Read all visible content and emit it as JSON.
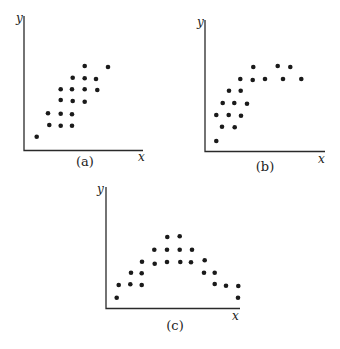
{
  "figure": {
    "colors": {
      "dot": "#1a1a1a",
      "axis": "#2a2a2a",
      "background": "#ffffff"
    }
  },
  "chart_data": [
    {
      "type": "scatter",
      "panel_label": "(a)",
      "xlabel": "x",
      "ylabel": "y",
      "grid": false,
      "pattern": "positive linear",
      "layout": {
        "origin": [
          24,
          150.5
        ],
        "y_top": 16,
        "x_right": 143,
        "ylabel_pos": [
          16,
          22
        ],
        "xlabel_pos": [
          138,
          161
        ],
        "panel_label_pos": [
          85,
          166
        ]
      },
      "points": [
        [
          36.7,
          136.7
        ],
        [
          49.3,
          125
        ],
        [
          60.7,
          125.7
        ],
        [
          72,
          125.7
        ],
        [
          48,
          113.3
        ],
        [
          60.7,
          113.7
        ],
        [
          72,
          114.3
        ],
        [
          60.7,
          100
        ],
        [
          72.7,
          101
        ],
        [
          84.7,
          101.7
        ],
        [
          60.7,
          89.3
        ],
        [
          72,
          89.3
        ],
        [
          84.7,
          89.3
        ],
        [
          97.3,
          90
        ],
        [
          72.7,
          77.7
        ],
        [
          84.7,
          78.3
        ],
        [
          96,
          79
        ],
        [
          84.7,
          66
        ],
        [
          108,
          67
        ]
      ]
    },
    {
      "type": "scatter",
      "panel_label": "(b)",
      "xlabel": "x",
      "ylabel": "y",
      "grid": false,
      "pattern": "increasing then leveling off (curvilinear)",
      "layout": {
        "origin": [
          205,
          151.5
        ],
        "y_top": 20,
        "x_right": 325,
        "ylabel_pos": [
          197,
          26
        ],
        "xlabel_pos": [
          318,
          163
        ],
        "panel_label_pos": [
          265,
          171
        ]
      },
      "points": [
        [
          216.3,
          141
        ],
        [
          222,
          126.7
        ],
        [
          234.7,
          127.3
        ],
        [
          216.3,
          115
        ],
        [
          228.7,
          115
        ],
        [
          241,
          115.7
        ],
        [
          222.7,
          103
        ],
        [
          234.3,
          103
        ],
        [
          247,
          103.7
        ],
        [
          229,
          90.7
        ],
        [
          240.7,
          90.7
        ],
        [
          240.3,
          79
        ],
        [
          252.7,
          80
        ],
        [
          265,
          79
        ],
        [
          283,
          79
        ],
        [
          301.3,
          79
        ],
        [
          253.3,
          67
        ],
        [
          277.7,
          66
        ],
        [
          290.3,
          67
        ]
      ]
    },
    {
      "type": "scatter",
      "panel_label": "(c)",
      "xlabel": "x",
      "ylabel": "y",
      "grid": false,
      "pattern": "inverted U (quadratic)",
      "layout": {
        "origin": [
          106,
          308.5
        ],
        "y_top": 187,
        "x_right": 240,
        "ylabel_pos": [
          97,
          193
        ],
        "xlabel_pos": [
          232,
          320
        ],
        "panel_label_pos": [
          175,
          330
        ]
      },
      "points": [
        [
          116.7,
          297.7
        ],
        [
          238,
          297.7
        ],
        [
          118.7,
          285
        ],
        [
          130.3,
          284.3
        ],
        [
          141.7,
          285
        ],
        [
          214.7,
          284
        ],
        [
          226,
          285.7
        ],
        [
          238.3,
          286
        ],
        [
          131,
          272.7
        ],
        [
          141.7,
          273.3
        ],
        [
          204,
          272.7
        ],
        [
          214.7,
          272.7
        ],
        [
          142,
          261.7
        ],
        [
          154.7,
          263.7
        ],
        [
          167,
          262
        ],
        [
          180.3,
          262
        ],
        [
          191,
          262.3
        ],
        [
          204.7,
          260.3
        ],
        [
          154.3,
          249.7
        ],
        [
          167,
          249.7
        ],
        [
          179.7,
          249.7
        ],
        [
          192,
          249.7
        ],
        [
          167.3,
          237
        ],
        [
          179.7,
          236.3
        ]
      ]
    }
  ]
}
